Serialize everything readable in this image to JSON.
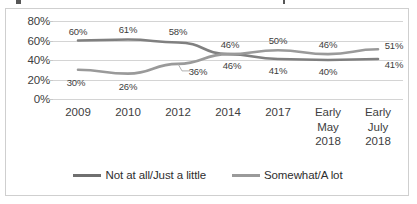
{
  "chart_data": {
    "type": "line",
    "title": "",
    "xlabel": "",
    "ylabel": "",
    "ylim": [
      0,
      80
    ],
    "ytick_labels": [
      "80%",
      "60%",
      "40%",
      "20%",
      "0%"
    ],
    "ytick_values": [
      80,
      60,
      40,
      20,
      0
    ],
    "grid": true,
    "legend_position": "bottom",
    "categories": [
      "2009",
      "2010",
      "2012",
      "2014",
      "2017",
      "Early May 2018",
      "Early July 2018"
    ],
    "category_lines": [
      [
        "2009"
      ],
      [
        "2010"
      ],
      [
        "2012"
      ],
      [
        "2014"
      ],
      [
        "2017"
      ],
      [
        "Early",
        "May",
        "2018"
      ],
      [
        "Early",
        "July",
        "2018"
      ]
    ],
    "series": [
      {
        "name": "Not at all/Just a little",
        "color": "#808080",
        "values": [
          60,
          61,
          58,
          46,
          41,
          40,
          41
        ],
        "labels": [
          "60%",
          "61%",
          "58%",
          "46%",
          "41%",
          "40%",
          "41%"
        ]
      },
      {
        "name": "Somewhat/A lot",
        "color": "#9a9a9a",
        "values": [
          30,
          26,
          36,
          46,
          50,
          46,
          51
        ],
        "labels": [
          "30%",
          "26%",
          "36%",
          "46%",
          "50%",
          "46%",
          "51%"
        ]
      }
    ],
    "annotations": [
      {
        "text": "36% label has a leader line to its data point"
      }
    ]
  },
  "legend": {
    "items": [
      {
        "label": "Not at all/Just a little",
        "color": "#6f6f6f"
      },
      {
        "label": "Somewhat/A lot",
        "color": "#9a9a9a"
      }
    ]
  },
  "colors": {
    "series_dark": "#808080",
    "series_light": "#9a9a9a",
    "gridline": "#d4d4d4",
    "frame": "#cfcfcf",
    "text": "#404040",
    "background": "#ffffff"
  }
}
